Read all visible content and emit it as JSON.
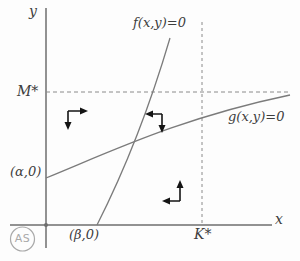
{
  "figure": {
    "axis_labels": {
      "y": "y",
      "x": "x"
    },
    "curve_labels": {
      "f": "f(x,y)=0",
      "g": "g(x,y)=0"
    },
    "point_labels": {
      "m_star": "M*",
      "k_star": "K*",
      "alpha": "(α,0)",
      "beta": "(β,0)"
    },
    "watermark": "AS",
    "colors": {
      "curve": "#7b7b7b",
      "axis": "#6e6e6e",
      "dashed": "#8a8a8a",
      "text": "#3d3d3d",
      "arrow": "#141414",
      "watermark": "#a9a9a9"
    }
  }
}
